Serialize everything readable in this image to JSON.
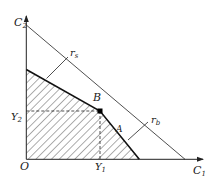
{
  "diagram": {
    "axes": {
      "x_label": "C",
      "x_sub": "1",
      "y_label": "C",
      "y_sub": "2",
      "origin_label": "O"
    },
    "guides": {
      "y2_label": "Y",
      "y2_sub": "2",
      "y1_label": "Y",
      "y1_sub": "1"
    },
    "points": {
      "b_label": "B",
      "a_label": "A"
    },
    "lines": {
      "rs_label": "r",
      "rs_sub": "s",
      "rb_label": "r",
      "rb_sub": "b"
    },
    "colors": {
      "ink": "#222222",
      "background": "#ffffff"
    }
  }
}
